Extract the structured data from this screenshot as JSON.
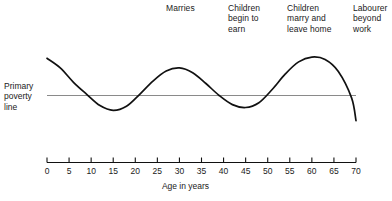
{
  "figure": {
    "poverty_line_label": "Primary\npoverty\nline",
    "axis_title": "Age in years",
    "annotations": [
      {
        "id": "marries",
        "text": "Marries",
        "age": 27
      },
      {
        "id": "children-begin-to-earn",
        "text": "Children\nbegin to\nearn",
        "age": 41
      },
      {
        "id": "children-marry-leave-home",
        "text": "Children\nmarry and\nleave home",
        "age": 55
      },
      {
        "id": "labourer-beyond-work",
        "text": "Labourer\nbeyond\nwork",
        "age": 69
      }
    ],
    "colors": {
      "curve": "#111111",
      "poverty_line": "#8a8a8a",
      "axis": "#111111",
      "text": "#1a1a1a",
      "background": "#ffffff"
    }
  },
  "chart_data": {
    "type": "line",
    "xlabel": "Age in years",
    "ylabel": "",
    "xlim": [
      0,
      70
    ],
    "xticks": [
      0,
      5,
      10,
      15,
      20,
      25,
      30,
      35,
      40,
      45,
      50,
      55,
      60,
      65,
      70
    ],
    "xtick_labels": [
      "0",
      "5",
      "10",
      "15",
      "20",
      "25",
      "30",
      "35",
      "40",
      "45",
      "50",
      "55",
      "60",
      "65",
      "70"
    ],
    "grid": false,
    "legend": null,
    "series": [
      {
        "name": "Income relative to primary poverty line",
        "x": [
          0,
          3,
          6,
          9,
          12,
          15,
          18,
          21,
          24,
          27,
          30,
          33,
          36,
          39,
          42,
          45,
          48,
          51,
          54,
          57,
          60,
          63,
          66,
          69,
          70
        ],
        "values": [
          1.55,
          1.15,
          0.55,
          0.05,
          -0.42,
          -0.62,
          -0.45,
          0.05,
          0.6,
          1.02,
          1.15,
          0.95,
          0.5,
          0.0,
          -0.38,
          -0.5,
          -0.3,
          0.25,
          0.9,
          1.4,
          1.6,
          1.5,
          1.0,
          -0.1,
          -1.05
        ]
      }
    ],
    "reference_line": {
      "name": "Primary poverty line",
      "value": 0,
      "label": "Primary poverty line",
      "orientation": "horizontal"
    },
    "annotations": [
      {
        "text": "Marries",
        "age": 27
      },
      {
        "text": "Children begin to earn",
        "age": 41
      },
      {
        "text": "Children marry and leave home",
        "age": 55
      },
      {
        "text": "Labourer beyond work",
        "age": 69
      }
    ]
  }
}
